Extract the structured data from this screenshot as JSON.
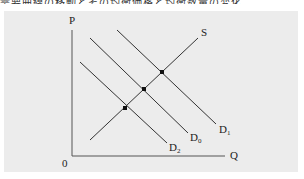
{
  "caption": "需要曲線の移動とその均衡価格と均衡数量の変化",
  "diagram": {
    "type": "supply-demand",
    "axes": {
      "y_label": "P",
      "x_label": "Q",
      "origin_label": "0"
    },
    "curves": [
      {
        "id": "S",
        "label": "S",
        "sub": "",
        "kind": "supply",
        "x1": 90,
        "y1": 140,
        "x2": 198,
        "y2": 38
      },
      {
        "id": "D1",
        "label": "D",
        "sub": "1",
        "kind": "demand",
        "x1": 117,
        "y1": 30,
        "x2": 216,
        "y2": 124
      },
      {
        "id": "D0",
        "label": "D",
        "sub": "0",
        "kind": "demand",
        "x1": 90,
        "y1": 38,
        "x2": 188,
        "y2": 133
      },
      {
        "id": "D2",
        "label": "D",
        "sub": "2",
        "kind": "demand",
        "x1": 80,
        "y1": 62,
        "x2": 167,
        "y2": 143
      }
    ],
    "equilibria": [
      {
        "x": 162,
        "y": 72,
        "demand": "D1"
      },
      {
        "x": 144,
        "y": 89,
        "demand": "D0"
      },
      {
        "x": 125,
        "y": 108,
        "demand": "D2"
      }
    ],
    "colors": {
      "panel": "#ececec",
      "line": "#333333",
      "point": "#111111"
    }
  }
}
